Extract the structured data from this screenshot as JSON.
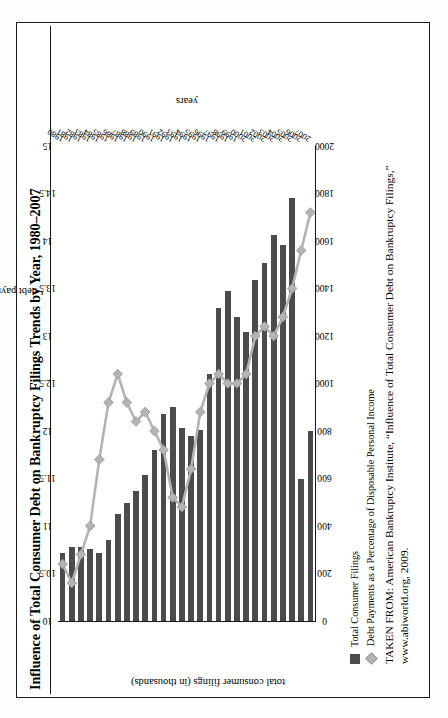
{
  "figure": {
    "title": "Influence of Total Consumer Debt on Bankruptcy Filings Trends by Year, 1980–2007",
    "source_line1": "TAKEN FROM: American Bankruptcy Institute, “Influence of Total Consumer Debt on Bankruptcy Filings,”",
    "source_line2": "www.abiworld.org, 2009.",
    "bar_color": "#4b4b4b",
    "line_color": "#b4b4b4"
  },
  "legend": {
    "items": [
      {
        "marker": "square-swatch",
        "label": "Total Consumer Filings"
      },
      {
        "marker": "diamond-swatch",
        "label": "Debt Payments as a Percentage of Disposable Personal Income"
      }
    ]
  },
  "chart_data": {
    "type": "bar",
    "title": "Influence of Total Consumer Debt on Bankruptcy Filings Trends by Year, 1980–2007",
    "xlabel": "years",
    "ylabel": "total consumer filings (in thousands)",
    "y2label": "debt payments as a percentage of disposable personal income",
    "categories": [
      "1980",
      "1981",
      "1982",
      "1983",
      "1984",
      "1985",
      "1986",
      "1987",
      "1988",
      "1989",
      "1990",
      "1991",
      "1992",
      "1993",
      "1994",
      "1995",
      "1996",
      "1997",
      "1998",
      "1999",
      "2000",
      "2001",
      "2002",
      "2003",
      "2004",
      "2005",
      "2006",
      "2007"
    ],
    "ylim": [
      0,
      2000
    ],
    "yticks": [
      0,
      200,
      400,
      600,
      800,
      1000,
      1200,
      1400,
      1600,
      1800,
      2000
    ],
    "y2lim": [
      10,
      15
    ],
    "y2ticks": [
      10,
      10.5,
      11,
      11.5,
      12,
      12.5,
      13,
      13.5,
      14,
      14.5,
      15
    ],
    "grid": false,
    "legend_position": "below-left",
    "series": [
      {
        "name": "Total Consumer Filings",
        "axis": "left",
        "units": "thousands",
        "type": "bar",
        "values": [
          287,
          313,
          311,
          304,
          285,
          341,
          449,
          495,
          549,
          616,
          718,
          873,
          901,
          813,
          780,
          806,
          1042,
          1317,
          1389,
          1281,
          1217,
          1437,
          1508,
          1625,
          1584,
          1782,
          598,
          802
        ]
      },
      {
        "name": "Debt Payments as a Percentage of Disposable Personal Income",
        "axis": "right",
        "units": "percent",
        "type": "line",
        "values": [
          10.6,
          10.4,
          10.7,
          11.0,
          11.7,
          12.3,
          12.6,
          12.3,
          12.1,
          12.2,
          12.0,
          11.8,
          11.3,
          11.2,
          11.6,
          12.2,
          12.5,
          12.6,
          12.5,
          12.5,
          12.6,
          13.0,
          13.1,
          13.0,
          13.2,
          13.5,
          13.9,
          14.3
        ]
      }
    ]
  }
}
